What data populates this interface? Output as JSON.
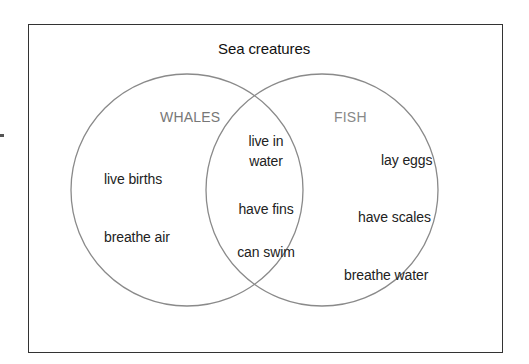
{
  "diagram": {
    "title": "Sea creatures",
    "type": "venn",
    "sets": [
      {
        "name": "WHALES",
        "color": "#777777",
        "items": [
          "live births",
          "breathe air"
        ]
      },
      {
        "name": "FISH",
        "color": "#888888",
        "items": [
          "lay eggs",
          "have scales",
          "breathe water"
        ]
      }
    ],
    "intersection": {
      "items": [
        "live in water",
        "have fins",
        "can swim"
      ],
      "item_lines": {
        "live_in_line1": "live in",
        "live_in_line2": "water"
      }
    },
    "colors": {
      "circle_stroke": "#8a8a8a",
      "frame_border": "#333333",
      "text": "#222222",
      "set_label": "#777777"
    }
  }
}
